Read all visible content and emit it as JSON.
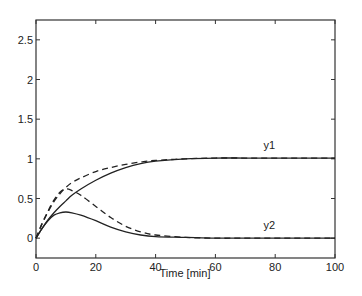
{
  "chart_data": {
    "type": "line",
    "title": "",
    "xlabel": "Time [min]",
    "ylabel": "",
    "xlim": [
      0,
      100
    ],
    "ylim": [
      -0.25,
      2.75
    ],
    "xticks": [
      0,
      20,
      40,
      60,
      80,
      100
    ],
    "yticks": [
      0,
      0.5,
      1,
      1.5,
      2,
      2.5
    ],
    "xtick_labels": [
      "0",
      "20",
      "40",
      "60",
      "80",
      "100"
    ],
    "ytick_labels": [
      "0",
      "0.5",
      "1",
      "1.5",
      "2",
      "2.5"
    ],
    "grid": false,
    "legend": "none",
    "annotations": [
      {
        "text": "y1",
        "x": 78,
        "y": 1.12
      },
      {
        "text": "y2",
        "x": 78,
        "y": 0.12
      }
    ],
    "x": [
      0,
      2,
      4,
      6,
      8,
      10,
      12,
      15,
      20,
      25,
      30,
      35,
      40,
      50,
      60,
      70,
      80,
      90,
      100
    ],
    "series": [
      {
        "name": "y1 (solid)",
        "style": "solid",
        "values": [
          0,
          0.12,
          0.23,
          0.32,
          0.4,
          0.47,
          0.54,
          0.62,
          0.73,
          0.82,
          0.89,
          0.94,
          0.97,
          1.0,
          1.01,
          1.01,
          1.01,
          1.01,
          1.01
        ]
      },
      {
        "name": "y1 (dashed)",
        "style": "dashed",
        "values": [
          0,
          0.18,
          0.33,
          0.46,
          0.56,
          0.64,
          0.7,
          0.76,
          0.84,
          0.89,
          0.93,
          0.96,
          0.98,
          1.0,
          1.01,
          1.01,
          1.01,
          1.01,
          1.01
        ]
      },
      {
        "name": "y2 (solid)",
        "style": "solid",
        "values": [
          0,
          0.12,
          0.22,
          0.29,
          0.32,
          0.33,
          0.32,
          0.29,
          0.22,
          0.14,
          0.08,
          0.04,
          0.02,
          0.01,
          0.0,
          0.0,
          0.0,
          0.0,
          0.0
        ]
      },
      {
        "name": "y2 (dashed)",
        "style": "dashed",
        "values": [
          0,
          0.18,
          0.34,
          0.48,
          0.58,
          0.62,
          0.6,
          0.54,
          0.4,
          0.26,
          0.15,
          0.08,
          0.04,
          0.01,
          0.0,
          0.0,
          0.0,
          0.0,
          0.0
        ]
      }
    ]
  }
}
